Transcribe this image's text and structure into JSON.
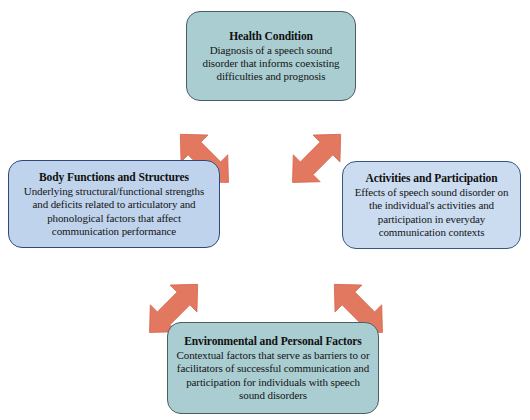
{
  "diagram": {
    "background_color": "#ffffff",
    "arrow_color": "#e2785f",
    "arrow_edge_color": "#d06b51",
    "nodes": [
      {
        "id": "health-condition",
        "title": "Health Condition",
        "description": "Diagnosis of a speech sound disorder that informs coexisting difficulties and prognosis",
        "fill": "#a9cdd1",
        "border": "#4a5f63",
        "position": "top"
      },
      {
        "id": "body-functions-and-structures",
        "title": "Body Functions and Structures",
        "description": "Underlying structural/functional strengths and deficits related to articulatory and phonological factors that affect communication performance",
        "fill": "#c0d3ec",
        "border": "#2f4a7a",
        "position": "left"
      },
      {
        "id": "activities-and-participation",
        "title": "Activities and Participation",
        "description": "Effects of speech sound disorder on the individual's activities and participation in everyday communication contexts",
        "fill": "#cbdcf0",
        "border": "#3a557f",
        "position": "right"
      },
      {
        "id": "environmental-and-personal-factors",
        "title": "Environmental and Personal Factors",
        "description": "Contextual factors that serve as barriers to or facilitators of successful communication and participation for individuals with speech sound disorders",
        "fill": "#a9cdd1",
        "border": "#4a5f63",
        "position": "bottom"
      }
    ],
    "connectors": [
      {
        "id": "health-to-body",
        "from": "health-condition",
        "to": "body-functions-and-structures",
        "style": "double-headed-diagonal"
      },
      {
        "id": "health-to-activities",
        "from": "health-condition",
        "to": "activities-and-participation",
        "style": "double-headed-diagonal"
      },
      {
        "id": "body-to-environment",
        "from": "body-functions-and-structures",
        "to": "environmental-and-personal-factors",
        "style": "double-headed-diagonal"
      },
      {
        "id": "activities-to-environment",
        "from": "activities-and-participation",
        "to": "environmental-and-personal-factors",
        "style": "double-headed-diagonal"
      }
    ]
  }
}
